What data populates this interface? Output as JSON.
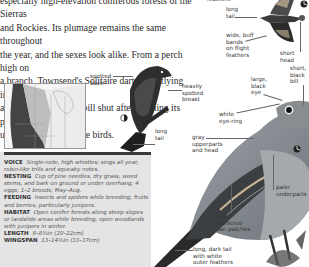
{
  "intro": {
    "lines": [
      "especially high-elevation coniferous forests of the Sierras",
      "and Rockies. Its plumage remains the same throughout",
      "the year, and the sexes look alike. From a perch high on",
      "a branch, Townsend's Solitaire darts after flying insects",
      "and audibly snaps its bill shut after catching its prey,",
      "unlike other thrush-like birds."
    ]
  },
  "flight_labels": {
    "feathers_top": "feathers",
    "long_tail": "long\ntail",
    "wide_buff_bands": "wide, buff\nbands\non flight\nfeathers",
    "short_head": "short\nhead"
  },
  "perched_back_labels": {
    "spotted_back": "spotted\nback",
    "heavily_spotted_breast": "heavily\nspotted\nbreast",
    "long_tail": "long\ntail"
  },
  "main_labels": {
    "short_black_bill": "short,\nblack\nbill",
    "large_black_eye": "large,\nblack\neye",
    "white_eye_ring": "white\neye-ring",
    "gray_upperparts": "gray\nupperparts\nand head",
    "paler_underparts": "paler\nunderparts",
    "pale_chestnut": "pale\nchestnut-\ntan patches",
    "long_dark_tail": "long, dark tail\nwith white\nouter feathers"
  },
  "icons": {
    "juvenile_icon": "half-moon-icon",
    "adult_icon": "adult-symbol-icon"
  },
  "info": {
    "voice_label": "VOICE",
    "voice_text": "Single-note, high whistles; sings all year, robin-like trills and squeaky notes.",
    "nesting_label": "NESTING",
    "nesting_text": "Cup of pine needles, dry grass, weed stems, and bark on ground or under overhang; 4 eggs; 1–2 broods; May–Aug.",
    "feeding_label": "FEEDING",
    "feeding_text": "Insects and spiders while breeding; fruits and berries, particularly junipers.",
    "habitat_label": "HABITAT",
    "habitat_text": "Open conifer forests along steep slopes or landslide areas while breeding; open woodlands with junipers in winter.",
    "length_label": "LENGTH",
    "length_text": "8–8½in (20–22cm)",
    "wingspan_label": "WINGSPAN",
    "wingspan_text": "13–14½in (33–37cm)"
  },
  "colors": {
    "infobox_bg": "#e4e4e4",
    "infobar": "#3a3a3a",
    "bird_gray": "#8a8f94",
    "bird_dark": "#2e2e2e"
  }
}
